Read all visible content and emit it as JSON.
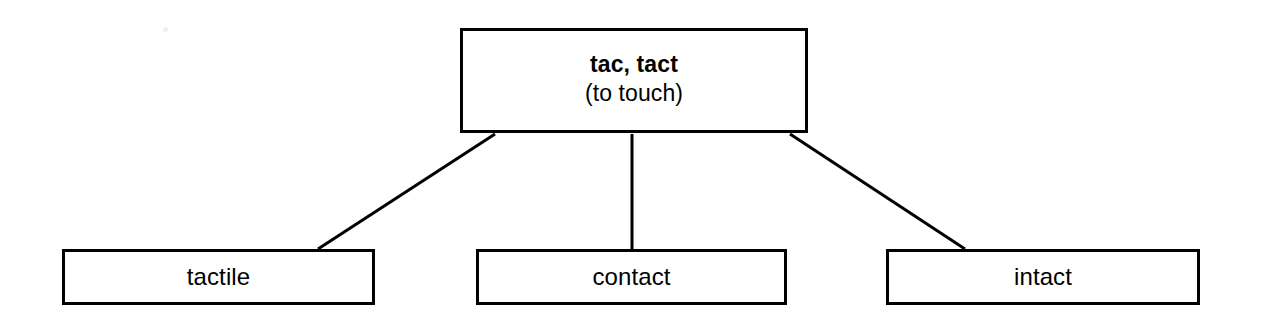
{
  "diagram": {
    "type": "word-tree",
    "background_color": "#ffffff",
    "line_color": "#000000",
    "root": {
      "root_forms": "tac, tact",
      "meaning": "(to touch)"
    },
    "children": [
      {
        "label": "tactile"
      },
      {
        "label": "contact"
      },
      {
        "label": "intact"
      }
    ],
    "connectors": [
      {
        "name": "root-to-tactile",
        "from_x": 495,
        "from_y": 134,
        "to_x": 318,
        "to_y": 249
      },
      {
        "name": "root-to-contact",
        "from_x": 632,
        "from_y": 134,
        "to_x": 632,
        "to_y": 249
      },
      {
        "name": "root-to-intact",
        "from_x": 790,
        "from_y": 134,
        "to_x": 965,
        "to_y": 249
      }
    ]
  }
}
